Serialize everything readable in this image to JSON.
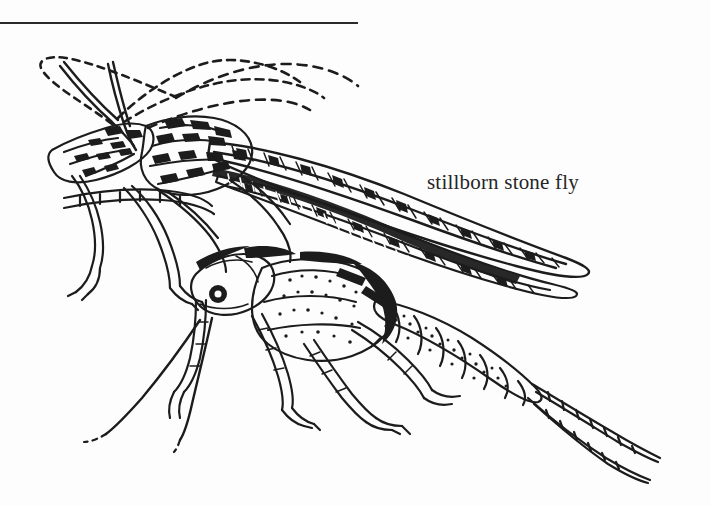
{
  "page": {
    "width": 711,
    "height": 506,
    "background_color": "#fdfdfd",
    "ink_color": "#1c1c1c"
  },
  "rule": {
    "name": "horizontal-rule",
    "x": 0,
    "y": 22,
    "width": 358,
    "thickness": 2,
    "color": "#2a2a2a"
  },
  "caption": {
    "text": "stillborn stone fly",
    "x": 427,
    "y": 170,
    "font_size_px": 21,
    "color": "#262626"
  },
  "illustration": {
    "title": "stillborn stone fly",
    "subject": "stonefly adult emerging from nymphal shuck",
    "style": "pen-and-ink line drawing",
    "medium": "black ink on white",
    "orientation": "head to upper-left, abdomen and cerci to lower-right",
    "parts": [
      "dashed antennae loops",
      "nymphal shuck head and thorax",
      "folded veined wings",
      "emerging adult body",
      "segmented abdomen",
      "paired cerci",
      "six legs with tarsi"
    ]
  }
}
